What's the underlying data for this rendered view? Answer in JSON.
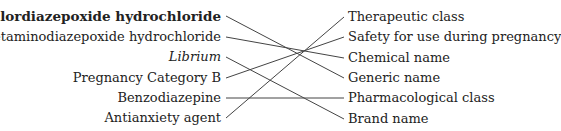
{
  "left_terms": [
    {
      "label": "chlordiazepoxide hydrochloride",
      "style": "bold"
    },
    {
      "label": "metaminodiazepoxide hydrochloride",
      "style": "normal"
    },
    {
      "label": "Librium",
      "style": "italic"
    },
    {
      "label": "Pregnancy Category B",
      "style": "normal"
    },
    {
      "label": "Benzodiazepine",
      "style": "normal"
    },
    {
      "label": "Antianxiety agent",
      "style": "normal"
    }
  ],
  "right_terms": [
    {
      "label": "Therapeutic class"
    },
    {
      "label": "Safety for use during pregnancy"
    },
    {
      "label": "Chemical name"
    },
    {
      "label": "Generic name"
    },
    {
      "label": "Pharmacological class"
    },
    {
      "label": "Brand name"
    }
  ],
  "connections": [
    {
      "from": "chlordiazepoxide hydrochloride",
      "to": "Generic name"
    },
    {
      "from": "metaminodiazepoxide hydrochloride",
      "to": "Chemical name"
    },
    {
      "from": "Librium",
      "to": "Brand name"
    },
    {
      "from": "Pregnancy Category B",
      "to": "Safety for use during pregnancy"
    },
    {
      "from": "Benzodiazepine",
      "to": "Pharmacological class"
    },
    {
      "from": "Antianxiety agent",
      "to": "Therapeutic class"
    }
  ]
}
